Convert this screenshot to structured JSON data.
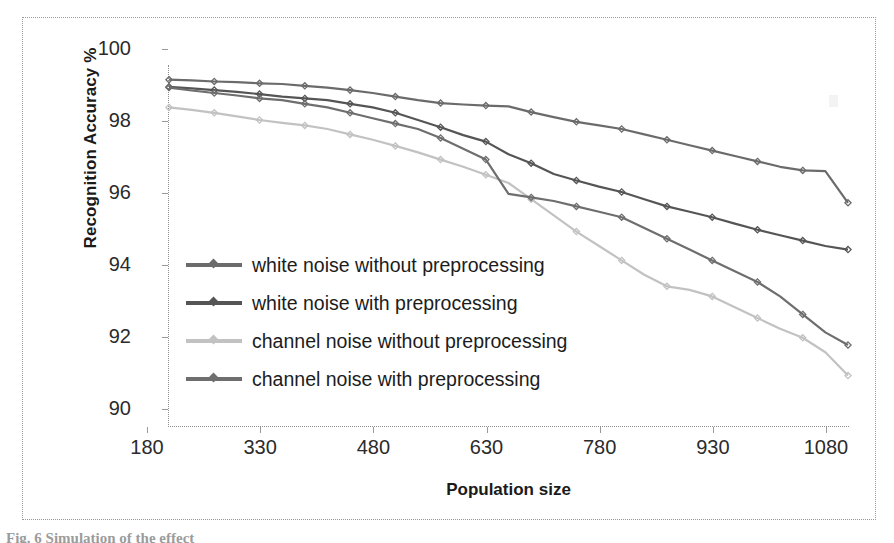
{
  "figure": {
    "caption": "Fig. 6  Simulation of the effect",
    "frame_border_color": "#9a9a9a"
  },
  "chart_data": {
    "type": "line",
    "title": "",
    "xlabel": "Population size",
    "ylabel": "Recognition Accuracy %",
    "xlim": [
      180,
      1080
    ],
    "ylim": [
      90,
      100
    ],
    "xticks": [
      180,
      330,
      480,
      630,
      780,
      930,
      1080
    ],
    "yticks": [
      90,
      92,
      94,
      96,
      98,
      100
    ],
    "grid": false,
    "legend_position": "center-left-inside",
    "marker": "diamond",
    "x": [
      180,
      210,
      240,
      270,
      300,
      330,
      360,
      390,
      420,
      450,
      480,
      510,
      540,
      570,
      600,
      630,
      660,
      690,
      720,
      750,
      780,
      810,
      840,
      870,
      900,
      930,
      960,
      990,
      1020,
      1050,
      1080
    ],
    "series": [
      {
        "name": "white noise without preprocessing",
        "color": "#6b6b6b",
        "values": [
          99.62,
          99.6,
          99.57,
          99.55,
          99.52,
          99.5,
          99.45,
          99.4,
          99.33,
          99.25,
          99.15,
          99.05,
          98.97,
          98.93,
          98.9,
          98.88,
          98.72,
          98.58,
          98.45,
          98.35,
          98.25,
          98.1,
          97.95,
          97.8,
          97.65,
          97.5,
          97.35,
          97.2,
          97.1,
          97.08,
          96.2
        ]
      },
      {
        "name": "white noise with preprocessing",
        "color": "#555555",
        "values": [
          99.42,
          99.38,
          99.33,
          99.28,
          99.22,
          99.15,
          99.1,
          99.05,
          98.95,
          98.85,
          98.7,
          98.5,
          98.3,
          98.08,
          97.9,
          97.55,
          97.3,
          97.0,
          96.82,
          96.65,
          96.5,
          96.3,
          96.1,
          95.95,
          95.8,
          95.62,
          95.45,
          95.3,
          95.15,
          95.0,
          94.9
        ]
      },
      {
        "name": "channel noise without preprocessing",
        "color": "#c2c2c2",
        "values": [
          98.85,
          98.78,
          98.7,
          98.6,
          98.5,
          98.42,
          98.35,
          98.25,
          98.1,
          97.95,
          97.78,
          97.6,
          97.4,
          97.2,
          96.98,
          96.75,
          96.3,
          95.85,
          95.4,
          95.0,
          94.6,
          94.2,
          93.88,
          93.78,
          93.6,
          93.3,
          93.0,
          92.7,
          92.45,
          92.05,
          91.4
        ]
      },
      {
        "name": "channel noise with preprocessing",
        "color": "#6e6e6e",
        "values": [
          99.4,
          99.32,
          99.25,
          99.18,
          99.1,
          99.05,
          98.95,
          98.85,
          98.7,
          98.55,
          98.4,
          98.25,
          98.0,
          97.7,
          97.4,
          96.45,
          96.35,
          96.25,
          96.1,
          95.95,
          95.8,
          95.5,
          95.2,
          94.9,
          94.6,
          94.3,
          94.0,
          93.6,
          93.1,
          92.6,
          92.25
        ]
      }
    ]
  }
}
